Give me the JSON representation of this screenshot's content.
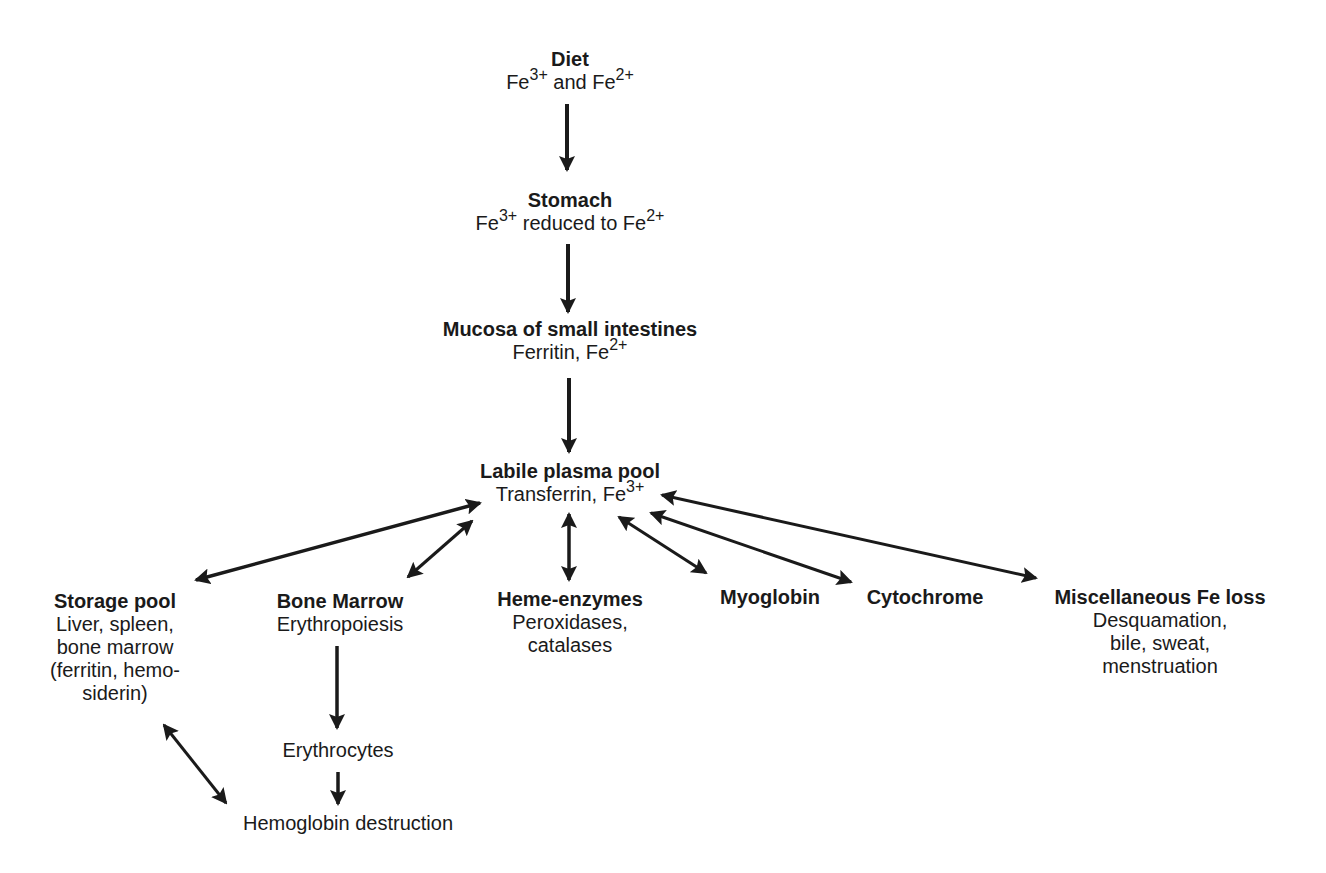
{
  "diagram": {
    "topic": "Iron metabolism pathway",
    "nodes": {
      "diet": {
        "title": "Diet",
        "line_prefix": "Fe",
        "sup1": "3+",
        "line_mid": " and Fe",
        "sup2": "2+"
      },
      "stomach": {
        "title": "Stomach",
        "line_prefix": "Fe",
        "sup1": "3+",
        "line_mid": " reduced to Fe",
        "sup2": "2+"
      },
      "mucosa": {
        "title": "Mucosa of small intestines",
        "line_prefix": "Ferritin, Fe",
        "sup1": "2+"
      },
      "plasma": {
        "title": "Labile plasma pool",
        "line_prefix": "Transferrin, Fe",
        "sup1": "3+"
      },
      "storage": {
        "title": "Storage pool",
        "lines": [
          "Liver, spleen,",
          "bone marrow",
          "(ferritin, hemo-",
          "siderin)"
        ]
      },
      "bone_marrow": {
        "title": "Bone Marrow",
        "lines": [
          "Erythropoiesis"
        ]
      },
      "heme_enzymes": {
        "title": "Heme-enzymes",
        "lines": [
          "Peroxidases,",
          "catalases"
        ]
      },
      "myoglobin": {
        "title": "Myoglobin"
      },
      "cytochrome": {
        "title": "Cytochrome"
      },
      "misc_loss": {
        "title": "Miscellaneous Fe loss",
        "lines": [
          "Desquamation,",
          "bile, sweat,",
          "menstruation"
        ]
      },
      "erythrocytes": {
        "title": "Erythrocytes"
      },
      "hemoglobin": {
        "title": "Hemoglobin destruction"
      }
    },
    "edges": [
      {
        "from": "diet",
        "to": "stomach",
        "type": "one-way"
      },
      {
        "from": "stomach",
        "to": "mucosa",
        "type": "one-way"
      },
      {
        "from": "mucosa",
        "to": "plasma",
        "type": "one-way"
      },
      {
        "from": "plasma",
        "to": "storage",
        "type": "two-way"
      },
      {
        "from": "plasma",
        "to": "bone_marrow",
        "type": "two-way"
      },
      {
        "from": "plasma",
        "to": "heme_enzymes",
        "type": "two-way"
      },
      {
        "from": "plasma",
        "to": "myoglobin",
        "type": "two-way"
      },
      {
        "from": "plasma",
        "to": "cytochrome",
        "type": "two-way"
      },
      {
        "from": "plasma",
        "to": "misc_loss",
        "type": "two-way"
      },
      {
        "from": "bone_marrow",
        "to": "erythrocytes",
        "type": "one-way"
      },
      {
        "from": "erythrocytes",
        "to": "hemoglobin",
        "type": "one-way"
      },
      {
        "from": "storage",
        "to": "hemoglobin",
        "type": "two-way"
      }
    ],
    "colors": {
      "ink": "#1a1a1a",
      "background": "#ffffff"
    }
  }
}
